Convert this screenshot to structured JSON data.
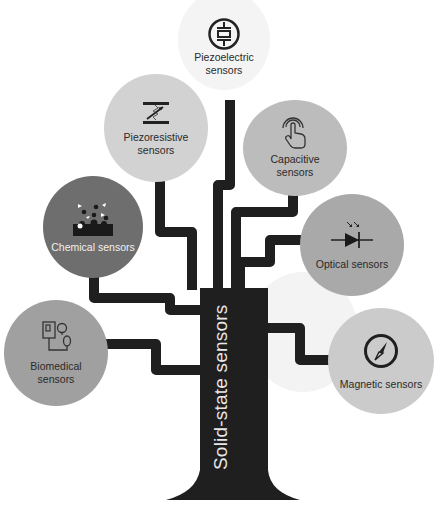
{
  "diagram": {
    "title": "Solid-state sensors",
    "type": "tree",
    "colors": {
      "trunk": "#1f1f1f",
      "node_light": "#f2f2f2",
      "node_mid": "#c9c9c9",
      "node_dark": "#8f8f8f",
      "node_darker": "#6e6e6e",
      "text_dark": "#2a2a2a",
      "text_light": "#f0f0f0"
    },
    "nodes": [
      {
        "id": "piezoelectric",
        "line1": "Piezoelectric",
        "line2": "sensors",
        "icon": "piezo-crystal-icon"
      },
      {
        "id": "piezoresistive",
        "line1": "Piezoresistive",
        "line2": "sensors",
        "icon": "variable-resistor-icon"
      },
      {
        "id": "capacitive",
        "line1": "Capacitive",
        "line2": "sensors",
        "icon": "touch-hand-icon"
      },
      {
        "id": "chemical",
        "line1": "Chemical sensors",
        "line2": "",
        "icon": "molecules-icon"
      },
      {
        "id": "optical",
        "line1": "Optical sensors",
        "line2": "",
        "icon": "photodiode-icon"
      },
      {
        "id": "biomedical",
        "line1": "Biomedical",
        "line2": "sensors",
        "icon": "blood-pressure-icon"
      },
      {
        "id": "magnetic",
        "line1": "Magnetic sensors",
        "line2": "",
        "icon": "compass-icon"
      }
    ]
  }
}
